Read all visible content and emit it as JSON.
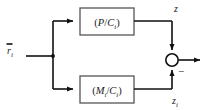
{
  "diagram": {
    "background_color": "#ffffff",
    "line_color": "#111111",
    "block_stroke_color": "#555555",
    "text_color": "#1a1a1a"
  },
  "input": {
    "label_base": "r",
    "label_sub": "i",
    "overbar": true,
    "name": "r-bar-i"
  },
  "blocks": [
    {
      "id": "top",
      "open_paren": "(",
      "numerator": "P",
      "slash": "/",
      "denominator": "C",
      "denominator_sub": "i",
      "close_paren": ")",
      "full_text": "(P/Ci)"
    },
    {
      "id": "bottom",
      "open_paren": "(",
      "numerator": "M",
      "numerator_sub": "i",
      "slash": "/",
      "denominator": "C",
      "denominator_sub": "i",
      "close_paren": ")",
      "full_text": "(Mi/Ci)"
    }
  ],
  "signals": {
    "top_output": "z",
    "bottom_output_base": "z",
    "bottom_output_sub": "i",
    "sum_sign_positive": "",
    "sum_sign_negative": "−"
  },
  "junction": {
    "name": "summing-junction",
    "shape": "circle"
  }
}
